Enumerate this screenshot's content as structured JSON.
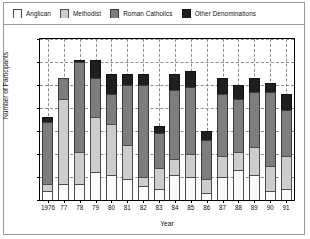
{
  "chart_data": {
    "type": "bar",
    "stacked": true,
    "title": "",
    "xlabel": "Year",
    "ylabel": "Number of Participants",
    "ylim": [
      0,
      70
    ],
    "ytick_step": 10,
    "yticks": [
      "0",
      "10",
      "20",
      "30",
      "40",
      "50",
      "60",
      "70"
    ],
    "grid": "dashed horizontal and vertical",
    "legend_position": "top",
    "categories": [
      "1976",
      "77",
      "78",
      "79",
      "80",
      "81",
      "82",
      "83",
      "84",
      "85",
      "86",
      "87",
      "88",
      "89",
      "90",
      "91"
    ],
    "series": [
      {
        "name": "Anglican",
        "color": "#fbfbfb",
        "values": [
          4,
          7,
          7,
          12,
          11,
          9,
          6,
          5,
          11,
          10,
          3,
          10,
          13,
          11,
          4,
          5
        ]
      },
      {
        "name": "Methodist",
        "color": "#cdcdcd",
        "values": [
          3,
          37,
          14,
          24,
          22,
          15,
          4,
          9,
          7,
          10,
          6,
          9,
          8,
          12,
          11,
          14
        ]
      },
      {
        "name": "Roman Catholics",
        "color": "#7d7d7d",
        "values": [
          27,
          9,
          39,
          17,
          13,
          26,
          40,
          15,
          30,
          29,
          17,
          27,
          23,
          24,
          32,
          20
        ]
      },
      {
        "name": "Other Denominations",
        "color": "#1f1f1f",
        "values": [
          2,
          0,
          1,
          8,
          9,
          5,
          5,
          3,
          7,
          7,
          4,
          7,
          6,
          6,
          4,
          7
        ]
      }
    ],
    "totals": [
      36,
      53,
      61,
      61,
      55,
      55,
      55,
      32,
      55,
      56,
      30,
      53,
      50,
      53,
      51,
      46
    ]
  },
  "legend": {
    "items": [
      {
        "label": "Anglican",
        "swatch_class": "seg-anglican"
      },
      {
        "label": "Methodist",
        "swatch_class": "seg-methodist"
      },
      {
        "label": "Roman Catholics",
        "swatch_class": "seg-catholic"
      },
      {
        "label": "Other Denominations",
        "swatch_class": "seg-other"
      }
    ]
  }
}
